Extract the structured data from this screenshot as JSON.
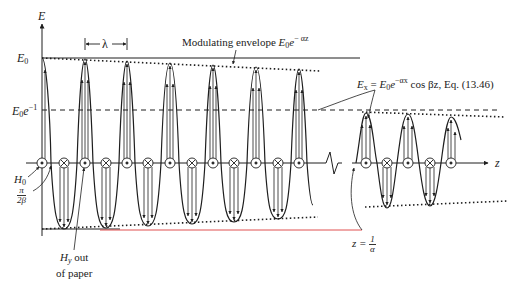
{
  "axes": {
    "vertical_label": "E",
    "horizontal_label": "z"
  },
  "levels": {
    "peak_label": "E",
    "peak_sub": "0",
    "decay_label": "E",
    "decay_sub": "0",
    "decay_base": "e",
    "decay_sup": "−1"
  },
  "annotations": {
    "wavelength": "λ",
    "envelope_text": "Modulating envelope ",
    "envelope_E": "E",
    "envelope_sub": "0",
    "envelope_e": "e",
    "envelope_sup": "− αz",
    "field_lhs": "E",
    "field_lhs_sub": "x",
    "field_eq": " = ",
    "field_E": "E",
    "field_sub": "0",
    "field_e": "e",
    "field_sup": "−αx",
    "field_rest": " cos βz, Eq. (13.46)",
    "h0_label": "H",
    "h0_sub": "0",
    "pi_num": "π",
    "pi_den": "2β",
    "hy_label": "H",
    "hy_sub": "y",
    "hy_rest": " out",
    "hy_line2": "of paper",
    "z_alpha_lhs": "z = ",
    "z_alpha_num": "1",
    "z_alpha_den": "α"
  },
  "colors": {
    "ink": "#1e1e1e",
    "baseline_red": "#e05050",
    "background": "#ffffff"
  },
  "wave": {
    "left_section": {
      "peaks_x": [
        42,
        85,
        127,
        170,
        213,
        256,
        299
      ],
      "wavelength_px": 43
    },
    "right_section": {
      "peaks_x": [
        366,
        408,
        451
      ],
      "troughs_x": [
        387,
        430
      ]
    }
  },
  "field_markers": {
    "left": [
      "dot",
      "cross",
      "dot",
      "cross",
      "dot",
      "cross",
      "dot",
      "cross",
      "dot",
      "cross",
      "dot",
      "cross",
      "dot"
    ],
    "right": [
      "dot",
      "cross",
      "dot",
      "cross",
      "dot"
    ]
  }
}
